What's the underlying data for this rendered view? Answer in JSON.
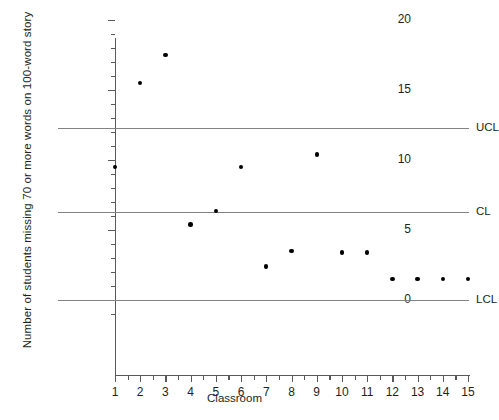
{
  "chart_data": {
    "type": "scatter",
    "title": "",
    "xlabel": "Classroom",
    "ylabel": "Number of students missing 70 or more words on 100-word story",
    "categories": [
      1,
      2,
      3,
      4,
      5,
      6,
      7,
      8,
      9,
      10,
      11,
      12,
      13,
      14,
      15
    ],
    "values": [
      9.5,
      15.5,
      17.5,
      5.4,
      6.35,
      9.5,
      2.4,
      3.5,
      10.4,
      3.4,
      3.4,
      1.5,
      1.5,
      1.5,
      1.5
    ],
    "xlim": [
      1,
      15
    ],
    "ylim": [
      -1.5,
      20
    ],
    "y_ticks_major": [
      0,
      5,
      10,
      15,
      20
    ],
    "y_ticks_minor": [
      1,
      2,
      3,
      4,
      6,
      7,
      8,
      9,
      11,
      12,
      13,
      14,
      16,
      17,
      18,
      19
    ],
    "x_ticks": [
      1,
      2,
      3,
      4,
      5,
      6,
      7,
      8,
      9,
      10,
      11,
      12,
      13,
      14,
      15
    ],
    "x_tick_labels": [
      "1",
      "2",
      "3",
      "4",
      "5",
      "6",
      "7",
      "8",
      "9",
      "10",
      "11",
      "12",
      "13",
      "14",
      "15"
    ],
    "y_tick_labels": [
      "0",
      "5",
      "10",
      "15",
      "20"
    ],
    "grid": false,
    "legend": "none",
    "control_lines": [
      {
        "name": "UCL",
        "label": "UCL",
        "value": 12.3
      },
      {
        "name": "CL",
        "label": "CL",
        "value": 6.3
      },
      {
        "name": "LCL",
        "label": "LCL",
        "value": 0
      }
    ],
    "line_color": "#808285",
    "point_color": "#000000",
    "axis_color": "#58595b",
    "text_color": "#231f20"
  }
}
